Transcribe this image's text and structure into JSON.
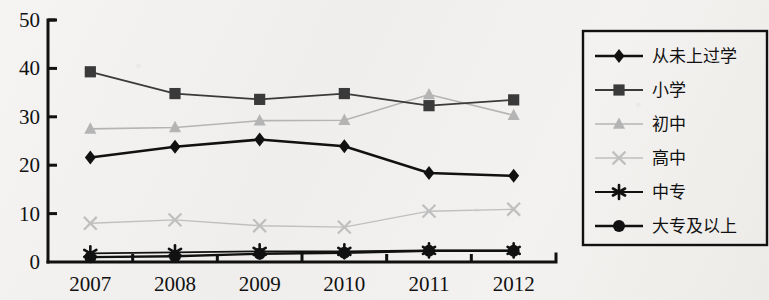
{
  "chart_data": {
    "type": "line",
    "title": "",
    "xlabel": "",
    "ylabel": "",
    "categories": [
      "2007",
      "2008",
      "2009",
      "2010",
      "2011",
      "2012"
    ],
    "x": [
      2007,
      2008,
      2009,
      2010,
      2011,
      2012
    ],
    "ylim": [
      0,
      50
    ],
    "ytick_labels": [
      "0",
      "10",
      "20",
      "30",
      "40",
      "50"
    ],
    "yticks": [
      0,
      10,
      20,
      30,
      40,
      50
    ],
    "grid": false,
    "legend_position": "right",
    "series": [
      {
        "name": "从未上过学",
        "marker": "diamond",
        "color": "#111111",
        "line_width": 2.6,
        "values": [
          21.6,
          23.8,
          25.3,
          23.9,
          18.4,
          17.8
        ]
      },
      {
        "name": "小学",
        "marker": "square",
        "color": "#3a3a3a",
        "line_width": 1.8,
        "values": [
          39.3,
          34.8,
          33.6,
          34.8,
          32.3,
          33.5
        ]
      },
      {
        "name": "初中",
        "marker": "triangle",
        "color": "#b4b4b4",
        "line_width": 1.6,
        "values": [
          27.5,
          27.8,
          29.2,
          29.3,
          34.6,
          30.3
        ]
      },
      {
        "name": "高中",
        "marker": "x",
        "color": "#bfbfbf",
        "line_width": 1.4,
        "values": [
          8.0,
          8.7,
          7.5,
          7.2,
          10.5,
          10.9
        ]
      },
      {
        "name": "中专",
        "marker": "asterisk",
        "color": "#111111",
        "line_width": 1.8,
        "values": [
          1.8,
          2.0,
          2.2,
          2.2,
          2.4,
          2.4
        ]
      },
      {
        "name": "大专及以上",
        "marker": "circle",
        "color": "#111111",
        "line_width": 2.4,
        "values": [
          1.0,
          1.2,
          1.7,
          1.9,
          2.3,
          2.3
        ]
      }
    ]
  }
}
